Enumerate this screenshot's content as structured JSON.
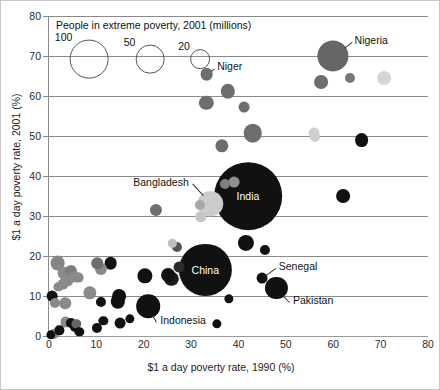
{
  "chart_data": {
    "type": "scatter",
    "title": "",
    "xlabel": "$1 a day poverty rate, 1990 (%)",
    "ylabel": "$1 a day poverty rate, 2001 (%)",
    "xlim": [
      0,
      80
    ],
    "ylim": [
      0,
      80
    ],
    "xticks": [
      0,
      10,
      20,
      30,
      40,
      50,
      60,
      70,
      80
    ],
    "yticks": [
      0,
      10,
      20,
      30,
      40,
      50,
      60,
      70,
      80
    ],
    "grid": "horizontal",
    "legend": {
      "title": "People in extreme poverty, 2001 (millions)",
      "position": "top-left-inside",
      "sizes": [
        100,
        50,
        20
      ],
      "size_labels": [
        "100",
        "50",
        "20"
      ],
      "style": "open-circle"
    },
    "size_key": "people_in_extreme_poverty_millions",
    "points": [
      {
        "name": "Nigeria",
        "x": 60.0,
        "y": 70.0,
        "size": 70,
        "color": "#666666",
        "labeled": true
      },
      {
        "name": "Niger",
        "x": 33.3,
        "y": 65.5,
        "size": 9,
        "color": "#6e6e6e",
        "labeled": true
      },
      {
        "name": "India",
        "x": 42.0,
        "y": 35.0,
        "size": 360,
        "color": "#111111",
        "labeled": true
      },
      {
        "name": "Bangladesh",
        "x": 34.0,
        "y": 33.0,
        "size": 45,
        "color": "#cccccc",
        "labeled": true
      },
      {
        "name": "China",
        "x": 33.0,
        "y": 16.5,
        "size": 210,
        "color": "#111111",
        "labeled": true
      },
      {
        "name": "Senegal",
        "x": 45.0,
        "y": 14.5,
        "size": 6,
        "color": "#111111",
        "labeled": true
      },
      {
        "name": "Pakistan",
        "x": 48.0,
        "y": 12.0,
        "size": 33,
        "color": "#111111",
        "labeled": true
      },
      {
        "name": "Indonesia",
        "x": 21.0,
        "y": 7.5,
        "size": 38,
        "color": "#111111",
        "labeled": true
      },
      {
        "name": "",
        "x": 33.2,
        "y": 58.3,
        "size": 12,
        "color": "#6e6e6e",
        "labeled": false
      },
      {
        "name": "",
        "x": 37.8,
        "y": 61.2,
        "size": 12,
        "color": "#6e6e6e",
        "labeled": false
      },
      {
        "name": "",
        "x": 41.2,
        "y": 57.2,
        "size": 6,
        "color": "#6e6e6e",
        "labeled": false
      },
      {
        "name": "",
        "x": 43.0,
        "y": 50.7,
        "size": 22,
        "color": "#6e6e6e",
        "labeled": false
      },
      {
        "name": "",
        "x": 36.5,
        "y": 47.5,
        "size": 10,
        "color": "#6e6e6e",
        "labeled": false
      },
      {
        "name": "",
        "x": 57.5,
        "y": 63.5,
        "size": 11,
        "color": "#6e6e6e",
        "labeled": false
      },
      {
        "name": "",
        "x": 63.5,
        "y": 64.5,
        "size": 5,
        "color": "#777777",
        "labeled": false
      },
      {
        "name": "",
        "x": 70.8,
        "y": 64.5,
        "size": 11,
        "color": "#d6d6d6",
        "labeled": false
      },
      {
        "name": "",
        "x": 56.0,
        "y": 50.8,
        "size": 6,
        "color": "#d0d0d0",
        "labeled": false
      },
      {
        "name": "",
        "x": 56.2,
        "y": 49.8,
        "size": 5,
        "color": "#cfcfcf",
        "labeled": false
      },
      {
        "name": "",
        "x": 66.0,
        "y": 49.0,
        "size": 11,
        "color": "#111111",
        "labeled": false
      },
      {
        "name": "",
        "x": 62.0,
        "y": 35.0,
        "size": 11,
        "color": "#111111",
        "labeled": false
      },
      {
        "name": "",
        "x": 39.0,
        "y": 38.5,
        "size": 6,
        "color": "#8f8f8f",
        "labeled": false
      },
      {
        "name": "",
        "x": 37.2,
        "y": 38.0,
        "size": 5,
        "color": "#7d7d7d",
        "labeled": false
      },
      {
        "name": "",
        "x": 31.8,
        "y": 32.8,
        "size": 5,
        "color": "#a8a8a8",
        "labeled": false
      },
      {
        "name": "",
        "x": 32.0,
        "y": 29.8,
        "size": 7,
        "color": "#c6c6c6",
        "labeled": false
      },
      {
        "name": "",
        "x": 22.5,
        "y": 31.5,
        "size": 8,
        "color": "#6e6e6e",
        "labeled": false
      },
      {
        "name": "",
        "x": 41.5,
        "y": 23.2,
        "size": 16,
        "color": "#111111",
        "labeled": false
      },
      {
        "name": "",
        "x": 45.5,
        "y": 21.5,
        "size": 5,
        "color": "#111111",
        "labeled": false
      },
      {
        "name": "",
        "x": 27.0,
        "y": 22.2,
        "size": 5,
        "color": "#555555",
        "labeled": false
      },
      {
        "name": "",
        "x": 26.0,
        "y": 23.2,
        "size": 3,
        "color": "#c0c0c0",
        "labeled": false
      },
      {
        "name": "",
        "x": 27.5,
        "y": 17.3,
        "size": 6,
        "color": "#2a2a2a",
        "labeled": false
      },
      {
        "name": "",
        "x": 1.8,
        "y": 18.2,
        "size": 13,
        "color": "#858585",
        "labeled": false
      },
      {
        "name": "",
        "x": 3.2,
        "y": 15.8,
        "size": 9,
        "color": "#8a8a8a",
        "labeled": false
      },
      {
        "name": "",
        "x": 4.0,
        "y": 14.0,
        "size": 7,
        "color": "#8a8a8a",
        "labeled": false
      },
      {
        "name": "",
        "x": 3.0,
        "y": 13.0,
        "size": 6,
        "color": "#8a8a8a",
        "labeled": false
      },
      {
        "name": "",
        "x": 4.6,
        "y": 16.2,
        "size": 8,
        "color": "#7d7d7d",
        "labeled": false
      },
      {
        "name": "",
        "x": 5.3,
        "y": 14.8,
        "size": 7,
        "color": "#8a8a8a",
        "labeled": false
      },
      {
        "name": "",
        "x": 6.2,
        "y": 14.6,
        "size": 6,
        "color": "#8a8a8a",
        "labeled": false
      },
      {
        "name": "",
        "x": 2.0,
        "y": 12.2,
        "size": 4,
        "color": "#8a8a8a",
        "labeled": false
      },
      {
        "name": "",
        "x": 8.6,
        "y": 10.7,
        "size": 10,
        "color": "#8a8a8a",
        "labeled": false
      },
      {
        "name": "",
        "x": 0.6,
        "y": 10.0,
        "size": 6,
        "color": "#111111",
        "labeled": false
      },
      {
        "name": "",
        "x": 1.2,
        "y": 8.2,
        "size": 5,
        "color": "#8a8a8a",
        "labeled": false
      },
      {
        "name": "",
        "x": 3.4,
        "y": 8.2,
        "size": 7,
        "color": "#8a8a8a",
        "labeled": false
      },
      {
        "name": "",
        "x": 11.0,
        "y": 16.8,
        "size": 8,
        "color": "#8a8a8a",
        "labeled": false
      },
      {
        "name": "",
        "x": 10.2,
        "y": 18.2,
        "size": 7,
        "color": "#6e6e6e",
        "labeled": false
      },
      {
        "name": "",
        "x": 13.0,
        "y": 18.3,
        "size": 9,
        "color": "#111111",
        "labeled": false
      },
      {
        "name": "",
        "x": 20.2,
        "y": 15.1,
        "size": 14,
        "color": "#111111",
        "labeled": false
      },
      {
        "name": "",
        "x": 25.2,
        "y": 15.2,
        "size": 11,
        "color": "#111111",
        "labeled": false
      },
      {
        "name": "",
        "x": 25.8,
        "y": 14.3,
        "size": 12,
        "color": "#1c1c1c",
        "labeled": false
      },
      {
        "name": "",
        "x": 14.8,
        "y": 10.0,
        "size": 11,
        "color": "#111111",
        "labeled": false
      },
      {
        "name": "",
        "x": 14.5,
        "y": 8.7,
        "size": 12,
        "color": "#111111",
        "labeled": false
      },
      {
        "name": "",
        "x": 11.0,
        "y": 8.6,
        "size": 5,
        "color": "#111111",
        "labeled": false
      },
      {
        "name": "",
        "x": 38.0,
        "y": 9.2,
        "size": 4,
        "color": "#111111",
        "labeled": false
      },
      {
        "name": "",
        "x": 35.4,
        "y": 3.0,
        "size": 4,
        "color": "#111111",
        "labeled": false
      },
      {
        "name": "",
        "x": 11.5,
        "y": 3.8,
        "size": 4,
        "color": "#111111",
        "labeled": false
      },
      {
        "name": "",
        "x": 10.2,
        "y": 2.0,
        "size": 5,
        "color": "#111111",
        "labeled": false
      },
      {
        "name": "",
        "x": 15.0,
        "y": 3.2,
        "size": 6,
        "color": "#111111",
        "labeled": false
      },
      {
        "name": "",
        "x": 17.0,
        "y": 4.2,
        "size": 4,
        "color": "#111111",
        "labeled": false
      },
      {
        "name": "",
        "x": 3.5,
        "y": 3.5,
        "size": 6,
        "color": "#8a8a8a",
        "labeled": false
      },
      {
        "name": "",
        "x": 4.6,
        "y": 3.2,
        "size": 5,
        "color": "#111111",
        "labeled": false
      },
      {
        "name": "",
        "x": 5.4,
        "y": 2.2,
        "size": 5,
        "color": "#111111",
        "labeled": false
      },
      {
        "name": "",
        "x": 5.8,
        "y": 3.0,
        "size": 4,
        "color": "#666666",
        "labeled": false
      },
      {
        "name": "",
        "x": 2.2,
        "y": 1.4,
        "size": 4,
        "color": "#111111",
        "labeled": false
      },
      {
        "name": "",
        "x": 1.0,
        "y": 0.6,
        "size": 5,
        "color": "#8a8a8a",
        "labeled": false
      },
      {
        "name": "",
        "x": 0.4,
        "y": 0.3,
        "size": 4,
        "color": "#111111",
        "labeled": false
      },
      {
        "name": "",
        "x": 6.4,
        "y": 1.0,
        "size": 4,
        "color": "#111111",
        "labeled": false
      }
    ],
    "annotations": [
      {
        "text": "Nigeria",
        "x": 64.5,
        "y": 74.0,
        "anchor": "start"
      },
      {
        "text": "Niger",
        "x": 35.5,
        "y": 67.5,
        "anchor": "start"
      },
      {
        "text": "Bangladesh",
        "x": 29.5,
        "y": 38.5,
        "anchor": "end"
      },
      {
        "text": "India",
        "x": 42.0,
        "y": 35.0,
        "anchor": "inside"
      },
      {
        "text": "China",
        "x": 33.0,
        "y": 16.5,
        "anchor": "inside"
      },
      {
        "text": "Senegal",
        "x": 48.5,
        "y": 17.5,
        "anchor": "start"
      },
      {
        "text": "Pakistan",
        "x": 51.5,
        "y": 9.0,
        "anchor": "start"
      },
      {
        "text": "Indonesia",
        "x": 23.5,
        "y": 4.0,
        "anchor": "start"
      }
    ]
  },
  "axes": {
    "x_title": "$1 a day poverty rate, 1990 (%)",
    "y_title": "$1 a day poverty rate, 2001 (%)",
    "x_tick_labels": [
      "0",
      "10",
      "20",
      "30",
      "40",
      "50",
      "60",
      "70",
      "80"
    ],
    "y_tick_labels": [
      "0",
      "10",
      "20",
      "30",
      "40",
      "50",
      "60",
      "70",
      "80"
    ]
  },
  "legend": {
    "title": "People in extreme poverty, 2001 (millions)",
    "items": [
      {
        "label": "100",
        "value": 100
      },
      {
        "label": "50",
        "value": 50
      },
      {
        "label": "20",
        "value": 20
      }
    ]
  },
  "colors": {
    "gridline": "#8a8a8a",
    "axis_text": "#2b2b2b",
    "label_text": "#111111",
    "background": "#ffffff",
    "border": "#c8c8c8"
  }
}
